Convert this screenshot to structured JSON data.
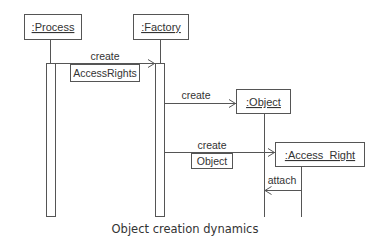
{
  "diagram": {
    "type": "uml-sequence",
    "objects": [
      {
        "id": "process",
        "label": ":Process"
      },
      {
        "id": "factory",
        "label": ":Factory"
      },
      {
        "id": "object",
        "label": ":Object"
      },
      {
        "id": "access_right",
        "label": ":Access_Right"
      }
    ],
    "messages": [
      {
        "from": "process",
        "to": "factory",
        "label": "create",
        "argument": "AccessRights"
      },
      {
        "from": "factory",
        "to": "object",
        "label": "create"
      },
      {
        "from": "factory",
        "to": "access_right",
        "label": "create",
        "argument": "Object"
      },
      {
        "from": "access_right",
        "to": "object",
        "label": "attach"
      }
    ],
    "caption": "Object creation dynamics"
  }
}
